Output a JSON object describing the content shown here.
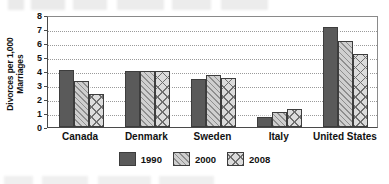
{
  "chart_data": {
    "type": "bar",
    "title": "",
    "xlabel": "",
    "ylabel": "Divorces per 1,000 Marriages",
    "ylabel_line1": "Divorces per 1,000",
    "ylabel_line2": "Marriages",
    "ylim": [
      0,
      8
    ],
    "yticks": [
      8,
      7,
      6,
      5,
      4,
      3,
      2,
      1,
      0
    ],
    "grid": true,
    "grid_axis": "y",
    "legend_position": "bottom-center",
    "categories": [
      "Canada",
      "Denmark",
      "Sweden",
      "Italy",
      "United States"
    ],
    "series": [
      {
        "name": "1990",
        "values": [
          4.1,
          4.0,
          3.45,
          0.7,
          7.15
        ],
        "color": "#5a5a5a",
        "pattern": "solid"
      },
      {
        "name": "2000",
        "values": [
          3.3,
          4.0,
          3.75,
          1.05,
          6.15
        ],
        "color": "#cfcfcf",
        "pattern": "diagonal-hatch"
      },
      {
        "name": "2008",
        "values": [
          2.35,
          4.0,
          3.5,
          1.3,
          5.25
        ],
        "color": "#dcdcdc",
        "pattern": "cross-hatch"
      }
    ]
  },
  "legend": {
    "items": [
      {
        "label": "1990"
      },
      {
        "label": "2000"
      },
      {
        "label": "2008"
      }
    ]
  },
  "colors": {
    "series_1990": "#5a5a5a",
    "series_2000": "#cfcfcf",
    "series_2008": "#dcdcdc",
    "axis": "#4a4a4a",
    "grid": "#9a9a9a",
    "text": "#111111",
    "background": "#ffffff"
  }
}
